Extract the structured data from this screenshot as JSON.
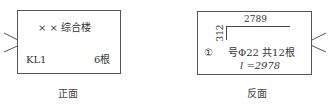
{
  "front": {
    "title": "× × 综合楼",
    "member": "KL1",
    "count": "6根",
    "caption": "正面"
  },
  "back": {
    "dim_horizontal": "2789",
    "dim_vertical": "312",
    "bar_number": "①",
    "spec": "号Φ22 共12根",
    "length": "l =2978",
    "caption": "反面"
  },
  "icons": {
    "left_hook": "wire-hook-icon",
    "right_hook": "wire-hook-icon"
  }
}
